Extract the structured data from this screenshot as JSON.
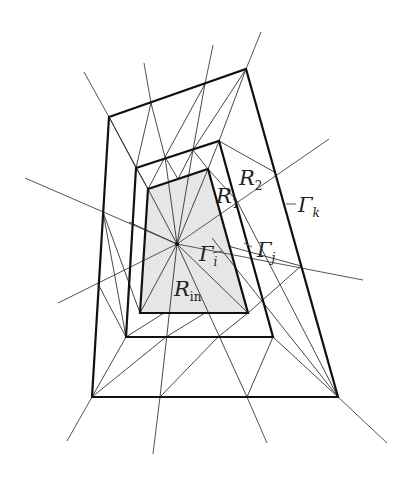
{
  "figure": {
    "labels": {
      "R_in": {
        "base": "R",
        "sub": "in"
      },
      "R_1": {
        "base": "R",
        "sub": "1"
      },
      "R_2": {
        "base": "R",
        "sub": "2"
      },
      "Gamma_i": {
        "base": "Γ",
        "sub": "i"
      },
      "Gamma_j": {
        "base": "Γ",
        "sub": "j"
      },
      "Gamma_k": {
        "base": "Γ",
        "sub": "k"
      }
    },
    "colors": {
      "region_fill": "#e6e6e6",
      "boundary": "#111111",
      "lines": "#555555"
    },
    "caption_partial": ""
  }
}
